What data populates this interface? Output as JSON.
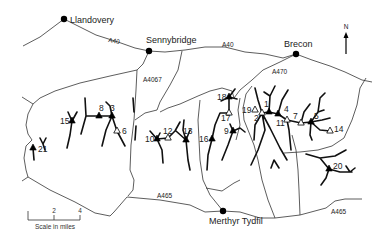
{
  "map": {
    "north_arrow": {
      "label": "N",
      "x": 346,
      "y_top": 32,
      "y_bottom": 54
    },
    "towns": [
      {
        "name": "Llandovery",
        "x": 64,
        "y": 19,
        "label_dx": 6,
        "label_dy": 4
      },
      {
        "name": "Sennybridge",
        "x": 149,
        "y": 51,
        "label_dx": -3,
        "label_dy": -8
      },
      {
        "name": "Brecon",
        "x": 296,
        "y": 54,
        "label_dx": -12,
        "label_dy": -7
      },
      {
        "name": "Merthyr Tydfil",
        "x": 223,
        "y": 211,
        "label_dx": -14,
        "label_dy": 13
      }
    ],
    "roads": [
      {
        "name": "A40",
        "x": 108,
        "y": 42,
        "rotate": 10
      },
      {
        "name": "A40",
        "x": 222,
        "y": 47,
        "rotate": 0
      },
      {
        "name": "A4067",
        "x": 143,
        "y": 82,
        "rotate": 0
      },
      {
        "name": "A470",
        "x": 272,
        "y": 74,
        "rotate": 0
      },
      {
        "name": "A465",
        "x": 157,
        "y": 198,
        "rotate": 0
      },
      {
        "name": "A465",
        "x": 331,
        "y": 214,
        "rotate": 0
      }
    ],
    "sites": [
      {
        "id": "1",
        "type": "filled",
        "x": 269,
        "y": 112,
        "lx": 264,
        "ly": 107
      },
      {
        "id": "2",
        "type": "open",
        "x": 262,
        "y": 113,
        "lx": 254,
        "ly": 121
      },
      {
        "id": "3",
        "type": "filled",
        "x": 112,
        "y": 116,
        "lx": 110,
        "ly": 111
      },
      {
        "name_note": "",
        "id": "4",
        "type": "filled",
        "x": 278,
        "y": 114,
        "lx": 284,
        "ly": 112
      },
      {
        "id": "5",
        "type": "filled",
        "x": 311,
        "y": 122,
        "lx": 314,
        "ly": 119
      },
      {
        "id": "6",
        "type": "open",
        "x": 117,
        "y": 131,
        "lx": 122,
        "ly": 134
      },
      {
        "id": "7",
        "type": "open",
        "x": 301,
        "y": 123,
        "lx": 293,
        "ly": 119
      },
      {
        "id": "8",
        "type": "filled",
        "x": 99,
        "y": 116,
        "lx": 99,
        "ly": 111
      },
      {
        "id": "9",
        "type": "filled",
        "x": 233,
        "y": 131,
        "lx": 224,
        "ly": 134
      },
      {
        "id": "10",
        "type": "filled",
        "x": 157,
        "y": 139,
        "lx": 145,
        "ly": 142
      },
      {
        "id": "11",
        "type": "open",
        "x": 287,
        "y": 120,
        "lx": 276,
        "ly": 126
      },
      {
        "id": "12",
        "type": "open",
        "x": 168,
        "y": 138,
        "lx": 163,
        "ly": 134
      },
      {
        "id": "13",
        "type": "filled",
        "x": 186,
        "y": 140,
        "lx": 183,
        "ly": 134
      },
      {
        "id": "14",
        "type": "open",
        "x": 330,
        "y": 131,
        "lx": 334,
        "ly": 132
      },
      {
        "id": "15",
        "type": "filled",
        "x": 72,
        "y": 121,
        "lx": 60,
        "ly": 124
      },
      {
        "id": "16",
        "type": "filled",
        "x": 212,
        "y": 139,
        "lx": 199,
        "ly": 142
      },
      {
        "id": "17",
        "type": "open",
        "x": 229,
        "y": 113,
        "lx": 221,
        "ly": 121
      },
      {
        "id": "18",
        "type": "filled",
        "x": 229,
        "y": 97,
        "lx": 217,
        "ly": 100
      },
      {
        "id": "19",
        "type": "open",
        "x": 255,
        "y": 110,
        "lx": 242,
        "ly": 113
      },
      {
        "id": "20",
        "type": "filled",
        "x": 329,
        "y": 169,
        "lx": 333,
        "ly": 169
      },
      {
        "id": "21",
        "type": "filled",
        "x": 33,
        "y": 148,
        "lx": 38,
        "ly": 152
      }
    ],
    "scale_bar": {
      "x0": 28,
      "x1": 80,
      "y": 220,
      "ticks": [
        {
          "x": 54,
          "label": "2"
        },
        {
          "x": 80,
          "label": "4"
        }
      ],
      "caption": "Scale in miles"
    }
  }
}
